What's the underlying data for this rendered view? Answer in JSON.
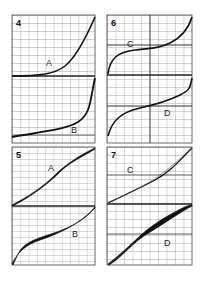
{
  "figure": {
    "panels": [
      {
        "id": "4",
        "label": "4",
        "curves": [
          {
            "label": "A"
          },
          {
            "label": "B"
          }
        ]
      },
      {
        "id": "6",
        "label": "6",
        "curves": [
          {
            "label": "C"
          },
          {
            "label": "D"
          }
        ]
      },
      {
        "id": "5",
        "label": "5",
        "curves": [
          {
            "label": "A"
          },
          {
            "label": "B"
          }
        ]
      },
      {
        "id": "7",
        "label": "7",
        "curves": [
          {
            "label": "C"
          },
          {
            "label": "D"
          }
        ]
      }
    ],
    "colors": {
      "grid": "#555555",
      "curve": "#111111",
      "background": "#ffffff"
    }
  }
}
